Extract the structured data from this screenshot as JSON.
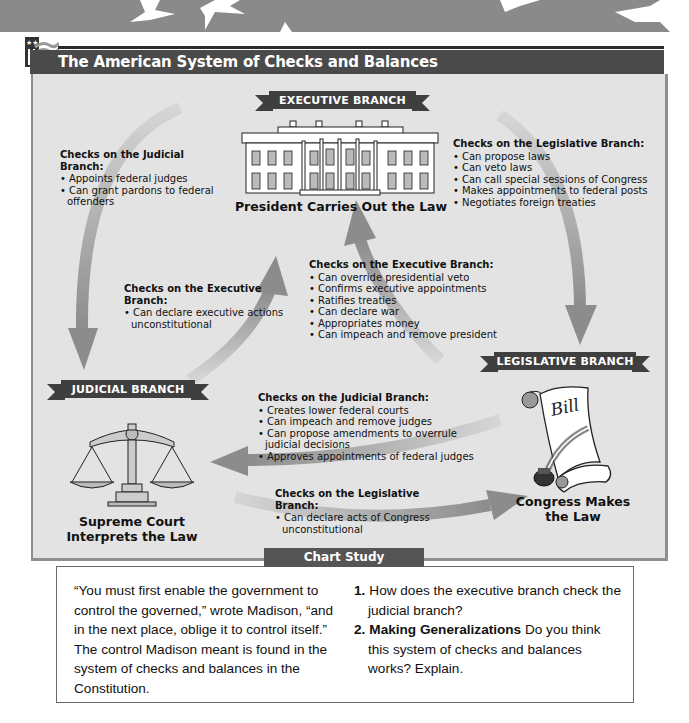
{
  "title": "The American System of Checks and Balances",
  "colors": {
    "banner": "#8a8a8a",
    "title_bar": "#4a4a4a",
    "panel_bg": "#e3e3e3",
    "ribbon": "#3f3f3f",
    "arrow": "#8c8c8c",
    "study_header": "#555555"
  },
  "branches": {
    "executive": {
      "label": "EXECUTIVE BRANCH",
      "icon": "white-house-icon",
      "caption": "President Carries Out the Law"
    },
    "legislative": {
      "label": "LEGISLATIVE BRANCH",
      "icon": "bill-scroll-icon",
      "caption_line1": "Congress Makes",
      "caption_line2": "the Law",
      "bill_text": "Bill"
    },
    "judicial": {
      "label": "JUDICIAL BRANCH",
      "icon": "scales-of-justice-icon",
      "caption_line1": "Supreme Court",
      "caption_line2": "Interprets the Law"
    }
  },
  "checks": {
    "exec_on_judicial": {
      "heading": "Checks on the Judicial Branch:",
      "items": [
        "Appoints federal judges",
        "Can grant pardons to federal offenders"
      ]
    },
    "exec_on_legislative": {
      "heading": "Checks on the Legislative Branch:",
      "items": [
        "Can propose laws",
        "Can veto laws",
        "Can call special sessions of Congress",
        "Makes appointments to federal posts",
        "Negotiates foreign treaties"
      ]
    },
    "judicial_on_exec": {
      "heading": "Checks on the Executive Branch:",
      "items": [
        "Can declare executive actions unconstitutional"
      ]
    },
    "legislative_on_exec": {
      "heading": "Checks on the Executive Branch:",
      "items": [
        "Can override presidential veto",
        "Confirms executive appointments",
        "Ratifies treaties",
        "Can declare war",
        "Appropriates money",
        "Can impeach and remove president"
      ]
    },
    "legislative_on_judicial": {
      "heading": "Checks on the Judicial Branch:",
      "items": [
        "Creates lower federal courts",
        "Can impeach and remove judges",
        "Can propose amendments to overrule judicial decisions",
        "Approves appointments of federal judges"
      ]
    },
    "judicial_on_legislative": {
      "heading": "Checks on the Legislative Branch:",
      "items": [
        "Can declare acts of Congress unconstitutional"
      ]
    }
  },
  "chart_study": {
    "header": "Chart Study",
    "quote": "“You must first enable the government to control the governed,” wrote Madison, “and in the next place, oblige it to control itself.”  The control Madison meant is found in the system of checks and balances in the Constitution.",
    "questions": [
      {
        "num": "1.",
        "bold": "",
        "text": "How does the executive branch check the judicial branch?"
      },
      {
        "num": "2.",
        "bold": "Making Generalizations",
        "text": "  Do you think this system of checks and balances works? Explain."
      }
    ]
  }
}
